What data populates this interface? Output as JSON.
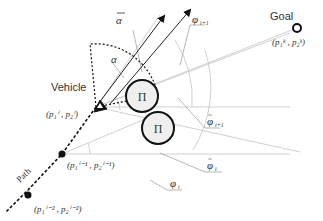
{
  "diagram": {
    "labels": {
      "vehicle": "Vehicle",
      "goal": "Goal",
      "path": "Path",
      "obstacle_symbol": "Π",
      "alpha": "α",
      "alpha_bar": "α",
      "phi_i1": "φ",
      "phi_i1_sub": "i+1",
      "phi_tilde_i1": "φ",
      "phi_tilde_i1_sub": "i+1",
      "phi_tilde_i": "φ",
      "phi_tilde_i_sub": "i",
      "phi_i": "φ",
      "phi_i_sub": "i",
      "goal_coord": "(p₁ᵏ , p₂ᵏ)",
      "vehicle_coord": "(p₁ⁱ , p₂ⁱ)",
      "prev1_coord": "(p₁ⁱ⁻¹ , p₂ⁱ⁻¹)",
      "prev2_coord": "(p₁ⁱ⁻² , p₂ⁱ⁻²)"
    },
    "colors": {
      "stroke_dark": "#111111",
      "stroke_light": "#bdbdbd",
      "obstacle_fill": "#efefef",
      "text": "#333333"
    }
  }
}
